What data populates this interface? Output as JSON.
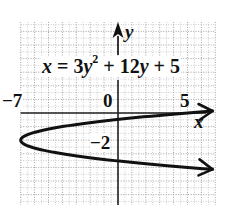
{
  "chart_data": {
    "type": "line",
    "equation": {
      "lhs": "x",
      "eq": " = ",
      "term1_coef": "3",
      "term1_var": "y",
      "term1_exp": "2",
      "plus1": " + ",
      "term2_coef": "12",
      "term2_var": "y",
      "plus2": " + ",
      "const": "5"
    },
    "xlabel": "x",
    "ylabel": "y",
    "x_tick_labels": [
      {
        "value": -7,
        "label": "−7"
      },
      {
        "value": 0,
        "label": "0"
      },
      {
        "value": 5,
        "label": "5"
      }
    ],
    "y_tick_labels": [
      {
        "value": -2,
        "label": "−2"
      }
    ],
    "xlim": [
      -7,
      7
    ],
    "ylim": [
      -6.5,
      6.5
    ],
    "grid": true,
    "grid_style": "dotted",
    "vertex": {
      "x": -7,
      "y": -2
    },
    "y_intercepts": [
      -0.47,
      -3.53
    ],
    "curve_points": [
      {
        "x": 6.8,
        "y": 0.16
      },
      {
        "x": 5,
        "y": 0
      },
      {
        "x": 0,
        "y": -0.47
      },
      {
        "x": -4,
        "y": -1
      },
      {
        "x": -7,
        "y": -2
      },
      {
        "x": -4,
        "y": -3
      },
      {
        "x": 0,
        "y": -3.53
      },
      {
        "x": 5,
        "y": -4
      },
      {
        "x": 6.8,
        "y": -4.16
      }
    ],
    "colors": {
      "curve": "#111111",
      "axes": "#222222",
      "grid": "#9a9a9a"
    }
  }
}
